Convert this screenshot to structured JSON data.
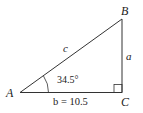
{
  "diagram": {
    "type": "right-triangle",
    "vertices": {
      "A": {
        "label": "A"
      },
      "B": {
        "label": "B"
      },
      "C": {
        "label": "C"
      }
    },
    "sides": {
      "c": {
        "label": "c"
      },
      "a": {
        "label": "a"
      },
      "b": {
        "label": "b = 10.5"
      }
    },
    "angle_A": {
      "label": "34.5°"
    },
    "right_angle_at": "C",
    "colors": {
      "stroke": "#333333",
      "text": "#222222"
    }
  }
}
